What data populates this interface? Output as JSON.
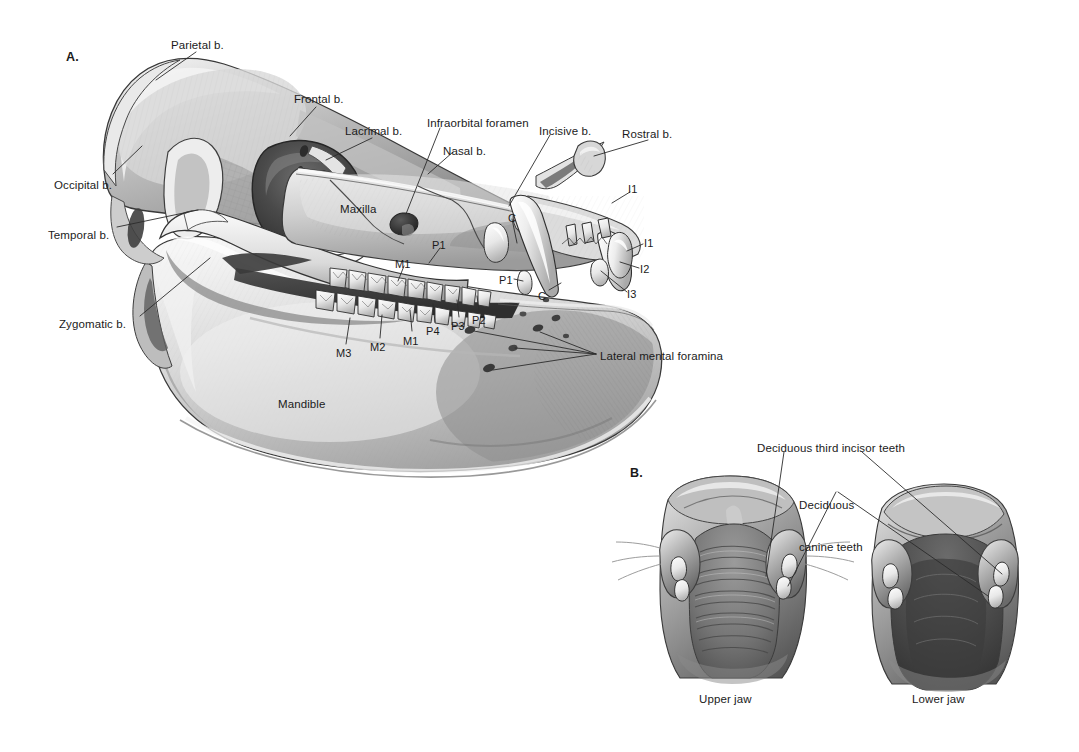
{
  "figure": {
    "type": "anatomical-illustration",
    "background_color": "#ffffff",
    "label_color": "#1b1b1b",
    "leader_line_color": "#2b2b2b"
  },
  "panels": [
    {
      "id": "A",
      "label": "A.",
      "x": 68,
      "y": 52,
      "caption": ""
    },
    {
      "id": "B",
      "label": "B.",
      "x": 630,
      "y": 467,
      "caption": ""
    }
  ],
  "panel_a": {
    "title": "A.",
    "bone_labels": [
      {
        "name": "parietal",
        "text": "Parietal b.",
        "x": 171,
        "y": 38,
        "anchor": "start",
        "leader": [
          [
            196,
            52
          ],
          [
            156,
            78
          ]
        ]
      },
      {
        "name": "frontal",
        "text": "Frontal b.",
        "x": 294,
        "y": 93,
        "anchor": "start",
        "leader": [
          [
            318,
            106
          ],
          [
            292,
            133
          ]
        ]
      },
      {
        "name": "lacrimal",
        "text": "Lacrimal b.",
        "x": 345,
        "y": 125,
        "anchor": "start",
        "leader": [
          [
            370,
            137
          ],
          [
            327,
            158
          ]
        ]
      },
      {
        "name": "occipital",
        "text": "Occipital b.",
        "x": 54,
        "y": 179,
        "anchor": "start",
        "leader": [
          [
            113,
            172
          ],
          [
            140,
            145
          ]
        ]
      },
      {
        "name": "temporal",
        "text": "Temporal b.",
        "x": 48,
        "y": 229,
        "anchor": "start",
        "leader": [
          [
            117,
            227
          ],
          [
            196,
            209
          ]
        ]
      },
      {
        "name": "zygomatic",
        "text": "Zygomatic b.",
        "x": 60,
        "y": 318,
        "anchor": "start",
        "leader": [
          [
            140,
            315
          ],
          [
            208,
            257
          ]
        ]
      },
      {
        "name": "maxilla",
        "text": "Maxilla",
        "x": 340,
        "y": 203,
        "anchor": "start",
        "leader": []
      },
      {
        "name": "mandible",
        "text": "Mandible",
        "x": 278,
        "y": 398,
        "anchor": "start",
        "leader": []
      },
      {
        "name": "nasal",
        "text": "Nasal b.",
        "x": 443,
        "y": 145,
        "anchor": "start",
        "leader": [
          [
            453,
            152
          ],
          [
            428,
            172
          ]
        ]
      },
      {
        "name": "infraorbital-foramen",
        "text": "Infraorbital foramen",
        "x": 428,
        "y": 117,
        "anchor": "start",
        "leader": [
          [
            438,
            126
          ],
          [
            406,
            216
          ]
        ]
      },
      {
        "name": "incisive",
        "text": "Incisive b.",
        "x": 540,
        "y": 125,
        "anchor": "start",
        "leader": [
          [
            548,
            133
          ],
          [
            508,
            205
          ]
        ]
      },
      {
        "name": "rostral",
        "text": "Rostral b.",
        "x": 622,
        "y": 128,
        "anchor": "start",
        "leader": [
          [
            648,
            139
          ],
          [
            592,
            155
          ]
        ]
      },
      {
        "name": "lateral-mental-foramina",
        "text": "Lateral mental foramina",
        "x": 600,
        "y": 351,
        "anchor": "start",
        "leader": [
          [
            596,
            356
          ],
          [
            538,
            330
          ]
        ]
      }
    ],
    "tooth_labels": [
      {
        "name": "upper-incisor-1",
        "text": "I1",
        "x": 629,
        "y": 184,
        "leader": [
          [
            630,
            192
          ],
          [
            612,
            202
          ]
        ]
      },
      {
        "name": "lower-incisor-1",
        "text": "I1",
        "x": 644,
        "y": 238,
        "leader": [
          [
            644,
            244
          ],
          [
            624,
            250
          ]
        ]
      },
      {
        "name": "lower-incisor-2",
        "text": "I2",
        "x": 641,
        "y": 264,
        "leader": [
          [
            640,
            268
          ],
          [
            620,
            262
          ]
        ]
      },
      {
        "name": "lower-incisor-3",
        "text": "I3",
        "x": 628,
        "y": 289,
        "leader": [
          [
            627,
            292
          ],
          [
            601,
            272
          ]
        ]
      },
      {
        "name": "upper-canine",
        "text": "C",
        "x": 509,
        "y": 213,
        "leader": [
          [
            512,
            219
          ],
          [
            518,
            247
          ]
        ]
      },
      {
        "name": "lower-canine",
        "text": "C",
        "x": 540,
        "y": 292,
        "leader": [
          [
            548,
            292
          ],
          [
            562,
            284
          ]
        ]
      },
      {
        "name": "upper-premolar-1",
        "text": "P1",
        "x": 433,
        "y": 240,
        "leader": [
          [
            440,
            248
          ],
          [
            428,
            262
          ]
        ]
      },
      {
        "name": "lower-premolar-1",
        "text": "P1",
        "x": 501,
        "y": 276,
        "leader": [
          [
            513,
            280
          ],
          [
            523,
            284
          ]
        ]
      },
      {
        "name": "upper-molar-1",
        "text": "M1",
        "x": 396,
        "y": 259,
        "leader": [
          [
            404,
            266
          ],
          [
            398,
            281
          ]
        ]
      },
      {
        "name": "lower-molar-3",
        "text": "M3",
        "x": 337,
        "y": 349,
        "leader": [
          [
            345,
            344
          ],
          [
            350,
            321
          ]
        ]
      },
      {
        "name": "lower-molar-2",
        "text": "M2",
        "x": 371,
        "y": 343,
        "leader": [
          [
            379,
            338
          ],
          [
            381,
            318
          ]
        ]
      },
      {
        "name": "lower-molar-1",
        "text": "M1",
        "x": 404,
        "y": 337,
        "leader": [
          [
            412,
            331
          ],
          [
            409,
            313
          ]
        ]
      },
      {
        "name": "lower-premolar-4",
        "text": "P4",
        "x": 427,
        "y": 327,
        "leader": [
          [
            435,
            321
          ],
          [
            432,
            306
          ]
        ]
      },
      {
        "name": "lower-premolar-3",
        "text": "P3",
        "x": 452,
        "y": 322,
        "leader": [
          [
            459,
            316
          ],
          [
            456,
            302
          ]
        ]
      },
      {
        "name": "lower-premolar-2",
        "text": "P2",
        "x": 473,
        "y": 316,
        "leader": [
          [
            479,
            310
          ],
          [
            476,
            297
          ]
        ]
      }
    ]
  },
  "panel_b": {
    "title": "B.",
    "labels": [
      {
        "name": "deciduous-third-incisor-teeth",
        "text": "Deciduous third incisor teeth",
        "x": 757,
        "y": 443,
        "lines": [
          "Deciduous third incisor teeth"
        ]
      },
      {
        "name": "deciduous-canine-teeth",
        "text": "Deciduous canine teeth",
        "x": 799,
        "y": 472,
        "lines": [
          "Deciduous",
          "canine teeth"
        ]
      }
    ],
    "captions": [
      {
        "name": "upper-jaw-caption",
        "text": "Upper jaw",
        "x": 727,
        "y": 698
      },
      {
        "name": "lower-jaw-caption",
        "text": "Lower jaw",
        "x": 939,
        "y": 698
      }
    ]
  }
}
